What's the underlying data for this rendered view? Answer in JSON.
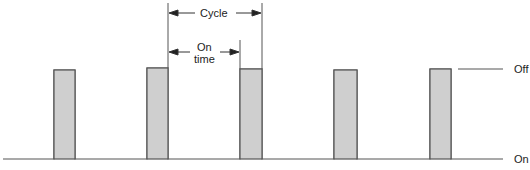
{
  "diagram": {
    "labels": {
      "cycle": "Cycle",
      "on_time_line1": "On",
      "on_time_line2": "time",
      "off": "Off",
      "on": "On"
    },
    "colors": {
      "line": "#555555",
      "pulse_fill": "#cfcfcf",
      "background": "#ffffff"
    },
    "pulses": [
      {
        "x_start": 54,
        "x_end": 75
      },
      {
        "x_start": 147,
        "x_end": 168
      },
      {
        "x_start": 240,
        "x_end": 262
      },
      {
        "x_start": 334,
        "x_end": 357
      },
      {
        "x_start": 430,
        "x_end": 451
      }
    ]
  }
}
